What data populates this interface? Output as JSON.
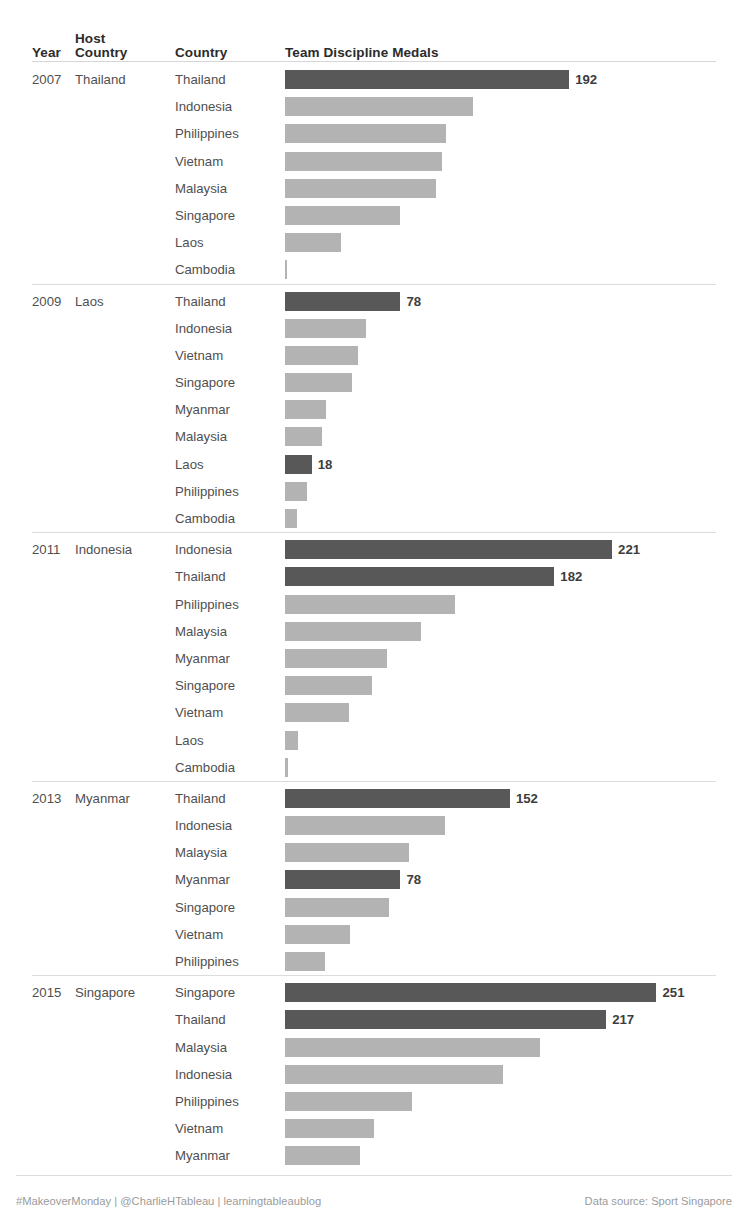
{
  "table": {
    "headers": {
      "year": "Year",
      "host_country": "Host Country",
      "host_country_line1": "Host",
      "host_country_line2": "Country",
      "country": "Country",
      "measure": "Team Discipline Medals"
    }
  },
  "footer": {
    "left": "#MakeoverMonday | @CharlieHTableau | learningtableaublog",
    "right": "Data source: Sport Singapore"
  },
  "colors": {
    "bar_default": "#b3b3b3",
    "bar_highlight": "#585858",
    "header_text": "#2b2b2b",
    "body_text": "#4f4f4f",
    "footer_text": "#9b9b9b",
    "rule": "#dcdcdc"
  },
  "chart_data": {
    "type": "bar",
    "title": "Team Discipline Medals",
    "xlabel": "Team Discipline Medals",
    "ylabel": "",
    "orientation": "horizontal",
    "grid": false,
    "legend": "none",
    "xlim": [
      0,
      251
    ],
    "px_per_unit": 1.48,
    "highlight_rule": "Host country bar is shaded dark; value label shown on dark bars and on the top bar of each group",
    "groups": [
      {
        "year": "2007",
        "host_country": "Thailand",
        "rows": [
          {
            "country": "Thailand",
            "value": 192,
            "label": "192",
            "highlight": true
          },
          {
            "country": "Indonesia",
            "value": 127,
            "label": "",
            "highlight": false
          },
          {
            "country": "Philippines",
            "value": 109,
            "label": "",
            "highlight": false
          },
          {
            "country": "Vietnam",
            "value": 106,
            "label": "",
            "highlight": false
          },
          {
            "country": "Malaysia",
            "value": 102,
            "label": "",
            "highlight": false
          },
          {
            "country": "Singapore",
            "value": 78,
            "label": "",
            "highlight": false
          },
          {
            "country": "Laos",
            "value": 38,
            "label": "",
            "highlight": false
          },
          {
            "country": "Cambodia",
            "value": 1,
            "label": "",
            "highlight": false
          }
        ]
      },
      {
        "year": "2009",
        "host_country": "Laos",
        "rows": [
          {
            "country": "Thailand",
            "value": 78,
            "label": "78",
            "highlight": true
          },
          {
            "country": "Indonesia",
            "value": 55,
            "label": "",
            "highlight": false
          },
          {
            "country": "Vietnam",
            "value": 49,
            "label": "",
            "highlight": false
          },
          {
            "country": "Singapore",
            "value": 45,
            "label": "",
            "highlight": false
          },
          {
            "country": "Myanmar",
            "value": 28,
            "label": "",
            "highlight": false
          },
          {
            "country": "Malaysia",
            "value": 25,
            "label": "",
            "highlight": false
          },
          {
            "country": "Laos",
            "value": 18,
            "label": "18",
            "highlight": true
          },
          {
            "country": "Philippines",
            "value": 15,
            "label": "",
            "highlight": false
          },
          {
            "country": "Cambodia",
            "value": 8,
            "label": "",
            "highlight": false
          }
        ]
      },
      {
        "year": "2011",
        "host_country": "Indonesia",
        "rows": [
          {
            "country": "Indonesia",
            "value": 221,
            "label": "221",
            "highlight": true
          },
          {
            "country": "Thailand",
            "value": 182,
            "label": "182",
            "highlight": true
          },
          {
            "country": "Philippines",
            "value": 115,
            "label": "",
            "highlight": false
          },
          {
            "country": "Malaysia",
            "value": 92,
            "label": "",
            "highlight": false
          },
          {
            "country": "Myanmar",
            "value": 69,
            "label": "",
            "highlight": false
          },
          {
            "country": "Singapore",
            "value": 59,
            "label": "",
            "highlight": false
          },
          {
            "country": "Vietnam",
            "value": 43,
            "label": "",
            "highlight": false
          },
          {
            "country": "Laos",
            "value": 9,
            "label": "",
            "highlight": false
          },
          {
            "country": "Cambodia",
            "value": 2,
            "label": "",
            "highlight": false
          }
        ]
      },
      {
        "year": "2013",
        "host_country": "Myanmar",
        "rows": [
          {
            "country": "Thailand",
            "value": 152,
            "label": "152",
            "highlight": true
          },
          {
            "country": "Indonesia",
            "value": 108,
            "label": "",
            "highlight": false
          },
          {
            "country": "Malaysia",
            "value": 84,
            "label": "",
            "highlight": false
          },
          {
            "country": "Myanmar",
            "value": 78,
            "label": "78",
            "highlight": true
          },
          {
            "country": "Singapore",
            "value": 70,
            "label": "",
            "highlight": false
          },
          {
            "country": "Vietnam",
            "value": 44,
            "label": "",
            "highlight": false
          },
          {
            "country": "Philippines",
            "value": 27,
            "label": "",
            "highlight": false
          }
        ]
      },
      {
        "year": "2015",
        "host_country": "Singapore",
        "rows": [
          {
            "country": "Singapore",
            "value": 251,
            "label": "251",
            "highlight": true
          },
          {
            "country": "Thailand",
            "value": 217,
            "label": "217",
            "highlight": true
          },
          {
            "country": "Malaysia",
            "value": 172,
            "label": "",
            "highlight": false
          },
          {
            "country": "Indonesia",
            "value": 147,
            "label": "",
            "highlight": false
          },
          {
            "country": "Philippines",
            "value": 86,
            "label": "",
            "highlight": false
          },
          {
            "country": "Vietnam",
            "value": 60,
            "label": "",
            "highlight": false
          },
          {
            "country": "Myanmar",
            "value": 51,
            "label": "",
            "highlight": false
          }
        ]
      }
    ]
  }
}
